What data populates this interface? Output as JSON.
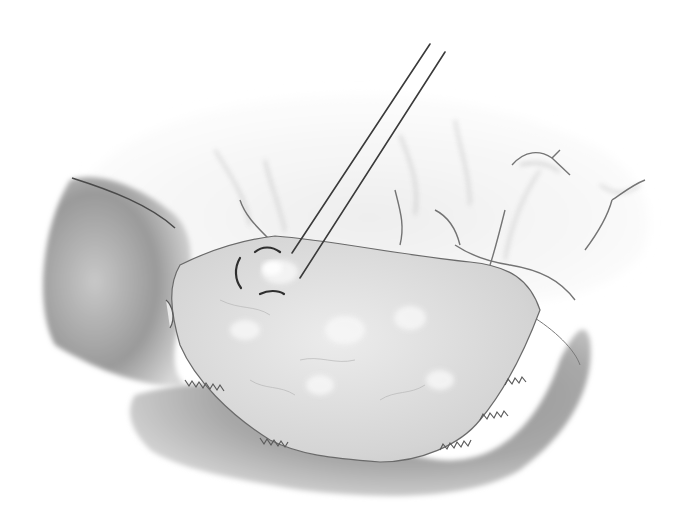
{
  "illustration": {
    "subject": "surgical-illustration",
    "palette": {
      "background": "#ffffff",
      "shadow_dark": "#7a7a7a",
      "shadow_mid": "#a9a9a9",
      "tissue_light": "#dcdcdc",
      "tissue_highlight": "#f4f4f4",
      "line_dark": "#3a3a3a"
    }
  }
}
